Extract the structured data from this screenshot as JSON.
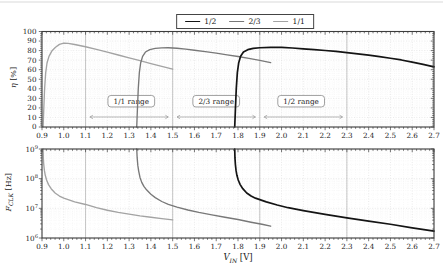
{
  "figure": {
    "legend": {
      "position": "top-center",
      "entries": [
        {
          "label": "1/2",
          "color": "#141414"
        },
        {
          "label": "2/3",
          "color": "#787878"
        },
        {
          "label": "1/1",
          "color": "#a3a3a3"
        }
      ]
    }
  },
  "chart_data": [
    {
      "type": "line",
      "title": "",
      "ylabel": {
        "symbol": "η",
        "sub": "",
        "unit": "[%]"
      },
      "xlim": [
        0.9,
        2.7
      ],
      "ylim": [
        0,
        100
      ],
      "grid": true,
      "x_tick_labels": [
        "0.9",
        "1.0",
        "1.1",
        "1.2",
        "1.3",
        "1.4",
        "1.5",
        "1.6",
        "1.7",
        "1.8",
        "1.9",
        "2.0",
        "2.1",
        "2.2",
        "2.3",
        "2.4",
        "2.5",
        "2.6",
        "2.7"
      ],
      "x_ticks": [
        0.9,
        1.0,
        1.1,
        1.2,
        1.3,
        1.4,
        1.5,
        1.6,
        1.7,
        1.8,
        1.9,
        2.0,
        2.1,
        2.2,
        2.3,
        2.4,
        2.5,
        2.6,
        2.7
      ],
      "x_minor_step": 0.02,
      "y_tick_labels": [
        "0",
        "10",
        "20",
        "30",
        "40",
        "50",
        "60",
        "70",
        "80",
        "90",
        "100"
      ],
      "y_ticks": [
        0,
        10,
        20,
        30,
        40,
        50,
        60,
        70,
        80,
        90,
        100
      ],
      "y_minor_step": 2,
      "guide_x": [
        1.1,
        1.5,
        1.9,
        2.3
      ],
      "series": [
        {
          "name": "1/2",
          "color": "#141414",
          "width": 1.7,
          "points": [
            [
              1.785,
              0
            ],
            [
              1.788,
              18
            ],
            [
              1.792,
              40
            ],
            [
              1.797,
              57
            ],
            [
              1.803,
              67
            ],
            [
              1.812,
              74
            ],
            [
              1.825,
              78.5
            ],
            [
              1.845,
              81
            ],
            [
              1.87,
              82.3
            ],
            [
              1.9,
              83
            ],
            [
              1.95,
              83.4
            ],
            [
              2.0,
              83.3
            ],
            [
              2.05,
              82.7
            ],
            [
              2.1,
              81.9
            ],
            [
              2.15,
              81.1
            ],
            [
              2.2,
              80.1
            ],
            [
              2.25,
              79.1
            ],
            [
              2.3,
              77.9
            ],
            [
              2.35,
              76.6
            ],
            [
              2.4,
              75.2
            ],
            [
              2.45,
              73.7
            ],
            [
              2.5,
              72
            ],
            [
              2.55,
              70.2
            ],
            [
              2.6,
              68
            ],
            [
              2.65,
              65.6
            ],
            [
              2.7,
              63
            ]
          ]
        },
        {
          "name": "2/3",
          "color": "#787878",
          "width": 1.35,
          "points": [
            [
              1.335,
              0
            ],
            [
              1.338,
              18
            ],
            [
              1.342,
              40
            ],
            [
              1.347,
              57
            ],
            [
              1.353,
              67
            ],
            [
              1.362,
              74
            ],
            [
              1.375,
              78.5
            ],
            [
              1.395,
              81
            ],
            [
              1.42,
              82.3
            ],
            [
              1.45,
              82.9
            ],
            [
              1.48,
              83
            ],
            [
              1.52,
              82.5
            ],
            [
              1.56,
              81.5
            ],
            [
              1.6,
              80.4
            ],
            [
              1.65,
              78.9
            ],
            [
              1.7,
              77.3
            ],
            [
              1.75,
              75.6
            ],
            [
              1.8,
              73.8
            ],
            [
              1.85,
              71.8
            ],
            [
              1.9,
              69.7
            ],
            [
              1.95,
              67.5
            ]
          ]
        },
        {
          "name": "1/1",
          "color": "#a3a3a3",
          "width": 1.35,
          "points": [
            [
              0.905,
              0
            ],
            [
              0.908,
              18
            ],
            [
              0.912,
              40
            ],
            [
              0.917,
              57
            ],
            [
              0.923,
              67
            ],
            [
              0.932,
              74
            ],
            [
              0.945,
              79.5
            ],
            [
              0.962,
              83.5
            ],
            [
              0.98,
              86.5
            ],
            [
              1.0,
              87.8
            ],
            [
              1.02,
              87.5
            ],
            [
              1.05,
              86.4
            ],
            [
              1.1,
              84
            ],
            [
              1.15,
              81.2
            ],
            [
              1.2,
              78.3
            ],
            [
              1.25,
              75.4
            ],
            [
              1.3,
              72.4
            ],
            [
              1.35,
              69.4
            ],
            [
              1.4,
              66.4
            ],
            [
              1.45,
              63.4
            ],
            [
              1.5,
              60.5
            ]
          ]
        }
      ],
      "annotations": [
        {
          "label": "1/1 range",
          "x": 1.31,
          "y": 27,
          "arrow": {
            "x1": 1.12,
            "x2": 1.48,
            "y": 10.5
          }
        },
        {
          "label": "2/3 range",
          "x": 1.7,
          "y": 27,
          "arrow": {
            "x1": 1.52,
            "x2": 1.88,
            "y": 10.5
          }
        },
        {
          "label": "1/2 range",
          "x": 2.09,
          "y": 27,
          "arrow": {
            "x1": 1.92,
            "x2": 2.28,
            "y": 10.5
          }
        }
      ]
    },
    {
      "type": "line",
      "title": "",
      "xlabel": {
        "symbol": "V",
        "sub": "IN",
        "unit": "[V]"
      },
      "ylabel": {
        "symbol": "F",
        "sub": "CLK",
        "unit": "[Hz]"
      },
      "xlim": [
        0.9,
        2.7
      ],
      "ylog": [
        6,
        9
      ],
      "grid": true,
      "x_tick_labels": [
        "0.9",
        "1.0",
        "1.1",
        "1.2",
        "1.3",
        "1.4",
        "1.5",
        "1.6",
        "1.7",
        "1.8",
        "1.9",
        "2.0",
        "2.1",
        "2.2",
        "2.3",
        "2.4",
        "2.5",
        "2.6",
        "2.7"
      ],
      "x_ticks": [
        0.9,
        1.0,
        1.1,
        1.2,
        1.3,
        1.4,
        1.5,
        1.6,
        1.7,
        1.8,
        1.9,
        2.0,
        2.1,
        2.2,
        2.3,
        2.4,
        2.5,
        2.6,
        2.7
      ],
      "x_minor_step": 0.02,
      "y_tick_base": "10",
      "y_tick_exponents": [
        "6",
        "7",
        "8",
        "9"
      ],
      "guide_x": [
        1.1,
        1.5,
        1.9,
        2.3
      ],
      "series": [
        {
          "name": "1/2",
          "color": "#141414",
          "width": 1.7,
          "points": [
            [
              1.785,
              1000000000.0
            ],
            [
              1.786,
              500000000.0
            ],
            [
              1.788,
              300000000.0
            ],
            [
              1.791,
              190000000.0
            ],
            [
              1.795,
              130000000.0
            ],
            [
              1.801,
              90000000.0
            ],
            [
              1.81,
              63000000.0
            ],
            [
              1.822,
              46000000.0
            ],
            [
              1.84,
              33000000.0
            ],
            [
              1.86,
              26000000.0
            ],
            [
              1.88,
              22000000.0
            ],
            [
              1.93,
              16500000.0
            ],
            [
              1.98,
              13000000.0
            ],
            [
              2.03,
              10500000.0
            ],
            [
              2.1,
              8400000.0
            ],
            [
              2.2,
              6300000.0
            ],
            [
              2.3,
              4800000.0
            ],
            [
              2.4,
              3700000.0
            ],
            [
              2.5,
              2900000.0
            ],
            [
              2.6,
              2200000.0
            ],
            [
              2.7,
              1700000.0
            ]
          ]
        },
        {
          "name": "2/3",
          "color": "#787878",
          "width": 1.35,
          "points": [
            [
              1.335,
              1000000000.0
            ],
            [
              1.337,
              500000000.0
            ],
            [
              1.34,
              280000000.0
            ],
            [
              1.344,
              180000000.0
            ],
            [
              1.35,
              110000000.0
            ],
            [
              1.358,
              75000000.0
            ],
            [
              1.368,
              55000000.0
            ],
            [
              1.38,
              42000000.0
            ],
            [
              1.4,
              30000000.0
            ],
            [
              1.42,
              23000000.0
            ],
            [
              1.45,
              17000000.0
            ],
            [
              1.48,
              13500000.0
            ],
            [
              1.52,
              11000000.0
            ],
            [
              1.57,
              8800000.0
            ],
            [
              1.62,
              7300000.0
            ],
            [
              1.68,
              6000000.0
            ],
            [
              1.74,
              5000000.0
            ],
            [
              1.8,
              4200000.0
            ],
            [
              1.86,
              3400000.0
            ],
            [
              1.91,
              2900000.0
            ],
            [
              1.95,
              2500000.0
            ]
          ]
        },
        {
          "name": "1/1",
          "color": "#a3a3a3",
          "width": 1.35,
          "points": [
            [
              0.905,
              1000000000.0
            ],
            [
              0.906,
              500000000.0
            ],
            [
              0.908,
              300000000.0
            ],
            [
              0.911,
              190000000.0
            ],
            [
              0.915,
              130000000.0
            ],
            [
              0.921,
              90000000.0
            ],
            [
              0.93,
              63000000.0
            ],
            [
              0.942,
              46000000.0
            ],
            [
              0.96,
              33000000.0
            ],
            [
              0.98,
              26000000.0
            ],
            [
              1.0,
              22000000.0
            ],
            [
              1.05,
              16500000.0
            ],
            [
              1.1,
              13500000.0
            ],
            [
              1.15,
              10500000.0
            ],
            [
              1.2,
              8600000.0
            ],
            [
              1.25,
              7300000.0
            ],
            [
              1.3,
              6400000.0
            ],
            [
              1.35,
              5600000.0
            ],
            [
              1.4,
              5000000.0
            ],
            [
              1.45,
              4500000.0
            ],
            [
              1.5,
              4100000.0
            ]
          ]
        }
      ]
    }
  ],
  "style_colors": {
    "grid_minor": "#efefef",
    "grid_major": "#dcdcdc",
    "guide_line": "#b8b8b8",
    "border": "#3d3d3d",
    "annotation_border": "#7a7a7a",
    "arrow": "#9a9a9a"
  }
}
